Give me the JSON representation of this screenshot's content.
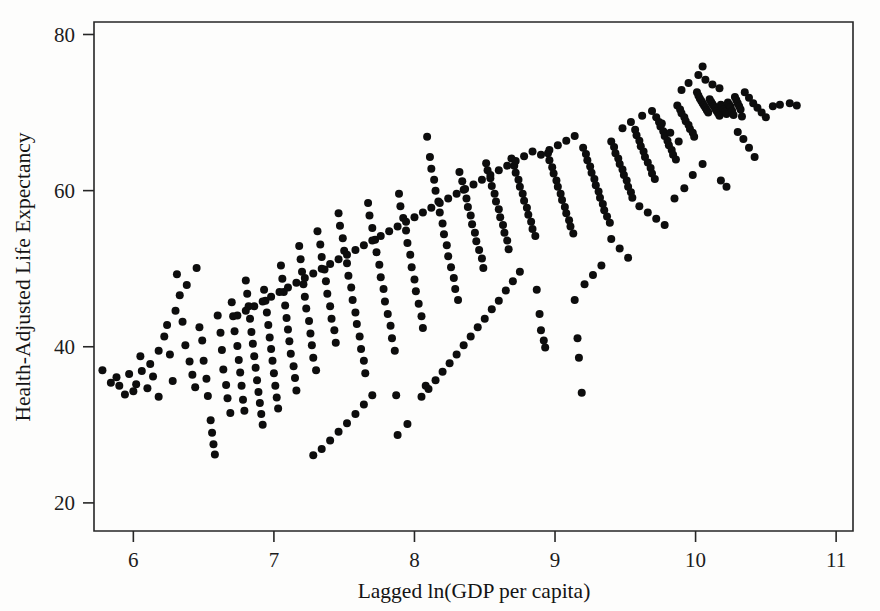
{
  "figure": {
    "type": "scatter-plot",
    "background_color": "#fdfdfc",
    "point_color": "#0d0d0d",
    "axis_color": "#262626"
  },
  "axes": {
    "x": {
      "label": "Lagged ln(GDP per capita)",
      "ticks": [
        "6",
        "7",
        "8",
        "9",
        "10",
        "11"
      ],
      "tick_values": [
        6,
        7,
        8,
        9,
        10,
        11
      ],
      "range": [
        5.72,
        11.12
      ]
    },
    "y": {
      "label": "Health-Adjusted Life Expectancy",
      "ticks": [
        "20",
        "80",
        "60",
        "40"
      ],
      "tick_labels": [
        "80",
        "60",
        "40",
        "20"
      ],
      "tick_values": [
        80,
        60,
        40,
        20
      ],
      "range": [
        16.4,
        81.6
      ]
    }
  },
  "chart_data": {
    "type": "scatter",
    "title": "",
    "xlabel": "Lagged ln(GDP per capita)",
    "ylabel": "Health-Adjusted Life Expectancy",
    "xlim": [
      5.72,
      11.12
    ],
    "ylim": [
      16.4,
      81.6
    ],
    "xticks": [
      6,
      7,
      8,
      9,
      10,
      11
    ],
    "yticks": [
      20,
      40,
      60,
      80
    ],
    "grid": false,
    "legend": null,
    "marker": "filled-circle",
    "marker_size_px": 8,
    "n_points": 420,
    "points": [
      [
        5.78,
        37.0
      ],
      [
        5.84,
        35.4
      ],
      [
        5.9,
        35.0
      ],
      [
        5.97,
        36.5
      ],
      [
        6.02,
        35.2
      ],
      [
        6.05,
        38.8
      ],
      [
        6.1,
        34.7
      ],
      [
        6.14,
        36.2
      ],
      [
        6.18,
        33.6
      ],
      [
        6.22,
        41.3
      ],
      [
        6.26,
        39.0
      ],
      [
        6.28,
        35.6
      ],
      [
        6.31,
        49.3
      ],
      [
        6.33,
        46.6
      ],
      [
        6.35,
        43.2
      ],
      [
        6.37,
        40.2
      ],
      [
        6.4,
        38.1
      ],
      [
        6.42,
        36.4
      ],
      [
        6.44,
        34.8
      ],
      [
        6.47,
        42.5
      ],
      [
        6.49,
        40.8
      ],
      [
        6.5,
        38.2
      ],
      [
        6.52,
        35.9
      ],
      [
        6.53,
        33.7
      ],
      [
        6.55,
        30.6
      ],
      [
        6.56,
        29.0
      ],
      [
        6.57,
        27.5
      ],
      [
        6.58,
        26.2
      ],
      [
        6.6,
        44.0
      ],
      [
        6.62,
        41.8
      ],
      [
        6.63,
        39.6
      ],
      [
        6.64,
        37.1
      ],
      [
        6.66,
        35.1
      ],
      [
        6.67,
        33.4
      ],
      [
        6.69,
        31.5
      ],
      [
        6.7,
        45.7
      ],
      [
        6.71,
        43.9
      ],
      [
        6.72,
        42.0
      ],
      [
        6.74,
        40.1
      ],
      [
        6.75,
        38.3
      ],
      [
        6.76,
        36.7
      ],
      [
        6.77,
        35.0
      ],
      [
        6.78,
        33.2
      ],
      [
        6.79,
        31.8
      ],
      [
        6.8,
        48.5
      ],
      [
        6.81,
        46.8
      ],
      [
        6.82,
        45.2
      ],
      [
        6.83,
        43.6
      ],
      [
        6.84,
        41.9
      ],
      [
        6.85,
        40.4
      ],
      [
        6.86,
        38.8
      ],
      [
        6.87,
        37.3
      ],
      [
        6.88,
        35.7
      ],
      [
        6.89,
        34.2
      ],
      [
        6.9,
        32.8
      ],
      [
        6.91,
        31.4
      ],
      [
        6.92,
        30.0
      ],
      [
        6.93,
        47.3
      ],
      [
        6.94,
        45.9
      ],
      [
        6.95,
        44.4
      ],
      [
        6.96,
        42.8
      ],
      [
        6.97,
        41.2
      ],
      [
        6.98,
        39.7
      ],
      [
        6.99,
        38.2
      ],
      [
        7.0,
        36.6
      ],
      [
        7.01,
        35.0
      ],
      [
        7.02,
        33.5
      ],
      [
        7.03,
        32.1
      ],
      [
        7.05,
        50.4
      ],
      [
        7.06,
        48.7
      ],
      [
        7.07,
        47.0
      ],
      [
        7.08,
        45.3
      ],
      [
        7.09,
        43.7
      ],
      [
        7.1,
        42.2
      ],
      [
        7.11,
        40.7
      ],
      [
        7.12,
        39.1
      ],
      [
        7.14,
        37.5
      ],
      [
        7.15,
        36.0
      ],
      [
        7.16,
        34.4
      ],
      [
        7.18,
        52.9
      ],
      [
        7.19,
        51.2
      ],
      [
        7.2,
        49.6
      ],
      [
        7.21,
        48.0
      ],
      [
        7.22,
        46.4
      ],
      [
        7.23,
        44.9
      ],
      [
        7.25,
        43.3
      ],
      [
        7.26,
        41.7
      ],
      [
        7.27,
        40.2
      ],
      [
        7.28,
        38.6
      ],
      [
        7.3,
        37.0
      ],
      [
        7.31,
        54.8
      ],
      [
        7.33,
        53.1
      ],
      [
        7.34,
        51.5
      ],
      [
        7.36,
        49.9
      ],
      [
        7.37,
        48.4
      ],
      [
        7.38,
        46.8
      ],
      [
        7.4,
        45.2
      ],
      [
        7.41,
        43.6
      ],
      [
        7.43,
        42.1
      ],
      [
        7.44,
        40.5
      ],
      [
        7.46,
        57.1
      ],
      [
        7.47,
        55.5
      ],
      [
        7.49,
        53.9
      ],
      [
        7.5,
        52.3
      ],
      [
        7.52,
        50.7
      ],
      [
        7.53,
        49.1
      ],
      [
        7.55,
        47.6
      ],
      [
        7.56,
        46.0
      ],
      [
        7.58,
        44.4
      ],
      [
        7.59,
        42.9
      ],
      [
        7.61,
        41.3
      ],
      [
        7.62,
        39.7
      ],
      [
        7.64,
        38.2
      ],
      [
        7.65,
        36.6
      ],
      [
        7.67,
        58.4
      ],
      [
        7.68,
        56.8
      ],
      [
        7.7,
        55.2
      ],
      [
        7.72,
        53.7
      ],
      [
        7.73,
        52.1
      ],
      [
        7.75,
        50.5
      ],
      [
        7.76,
        48.9
      ],
      [
        7.78,
        47.4
      ],
      [
        7.79,
        45.8
      ],
      [
        7.81,
        44.2
      ],
      [
        7.83,
        42.7
      ],
      [
        7.84,
        41.1
      ],
      [
        7.86,
        39.5
      ],
      [
        7.87,
        33.8
      ],
      [
        7.89,
        59.6
      ],
      [
        7.9,
        58.0
      ],
      [
        7.92,
        56.5
      ],
      [
        7.94,
        54.9
      ],
      [
        7.95,
        53.3
      ],
      [
        7.97,
        51.8
      ],
      [
        7.98,
        50.2
      ],
      [
        8.0,
        48.6
      ],
      [
        8.01,
        47.1
      ],
      [
        8.03,
        45.5
      ],
      [
        8.05,
        43.9
      ],
      [
        8.06,
        42.4
      ],
      [
        8.08,
        35.0
      ],
      [
        8.09,
        66.9
      ],
      [
        8.11,
        64.3
      ],
      [
        8.12,
        62.8
      ],
      [
        8.14,
        61.4
      ],
      [
        8.15,
        60.0
      ],
      [
        8.17,
        58.6
      ],
      [
        8.18,
        57.2
      ],
      [
        8.2,
        55.8
      ],
      [
        8.21,
        54.4
      ],
      [
        8.23,
        53.0
      ],
      [
        8.24,
        51.6
      ],
      [
        8.26,
        50.2
      ],
      [
        8.28,
        48.8
      ],
      [
        8.29,
        47.4
      ],
      [
        8.31,
        46.0
      ],
      [
        8.32,
        62.4
      ],
      [
        8.34,
        61.2
      ],
      [
        8.35,
        60.1
      ],
      [
        8.37,
        59.0
      ],
      [
        8.38,
        57.9
      ],
      [
        8.4,
        56.8
      ],
      [
        8.41,
        55.7
      ],
      [
        8.43,
        54.6
      ],
      [
        8.44,
        53.5
      ],
      [
        8.46,
        52.4
      ],
      [
        8.48,
        51.3
      ],
      [
        8.49,
        50.1
      ],
      [
        8.51,
        63.5
      ],
      [
        8.52,
        62.6
      ],
      [
        8.54,
        61.6
      ],
      [
        8.55,
        60.6
      ],
      [
        8.57,
        59.6
      ],
      [
        8.58,
        58.6
      ],
      [
        8.6,
        57.6
      ],
      [
        8.61,
        56.6
      ],
      [
        8.63,
        55.6
      ],
      [
        8.64,
        54.6
      ],
      [
        8.66,
        53.6
      ],
      [
        8.67,
        52.5
      ],
      [
        8.69,
        64.1
      ],
      [
        8.71,
        63.2
      ],
      [
        8.72,
        62.3
      ],
      [
        8.74,
        61.4
      ],
      [
        8.75,
        60.5
      ],
      [
        8.77,
        59.6
      ],
      [
        8.78,
        58.7
      ],
      [
        8.8,
        57.8
      ],
      [
        8.81,
        56.9
      ],
      [
        8.83,
        56.0
      ],
      [
        8.84,
        55.1
      ],
      [
        8.86,
        54.2
      ],
      [
        8.87,
        47.3
      ],
      [
        8.89,
        44.2
      ],
      [
        8.9,
        42.1
      ],
      [
        8.92,
        40.8
      ],
      [
        8.93,
        39.9
      ],
      [
        8.95,
        64.8
      ],
      [
        8.96,
        63.9
      ],
      [
        8.98,
        63.0
      ],
      [
        8.99,
        62.2
      ],
      [
        9.01,
        61.3
      ],
      [
        9.02,
        60.5
      ],
      [
        9.04,
        59.6
      ],
      [
        9.05,
        58.8
      ],
      [
        9.07,
        57.9
      ],
      [
        9.08,
        57.1
      ],
      [
        9.1,
        56.2
      ],
      [
        9.11,
        55.4
      ],
      [
        9.13,
        54.5
      ],
      [
        9.14,
        46.0
      ],
      [
        9.16,
        41.1
      ],
      [
        9.17,
        38.6
      ],
      [
        9.19,
        34.1
      ],
      [
        9.2,
        65.5
      ],
      [
        9.22,
        64.7
      ],
      [
        9.23,
        63.9
      ],
      [
        9.25,
        63.1
      ],
      [
        9.26,
        62.3
      ],
      [
        9.28,
        61.5
      ],
      [
        9.29,
        60.7
      ],
      [
        9.31,
        59.9
      ],
      [
        9.32,
        59.1
      ],
      [
        9.34,
        58.3
      ],
      [
        9.35,
        57.5
      ],
      [
        9.37,
        56.7
      ],
      [
        9.39,
        55.9
      ],
      [
        9.4,
        66.3
      ],
      [
        9.42,
        65.6
      ],
      [
        9.43,
        64.8
      ],
      [
        9.45,
        64.1
      ],
      [
        9.46,
        63.4
      ],
      [
        9.48,
        62.7
      ],
      [
        9.49,
        62.0
      ],
      [
        9.51,
        61.3
      ],
      [
        9.52,
        60.5
      ],
      [
        9.54,
        59.8
      ],
      [
        9.55,
        59.1
      ],
      [
        9.57,
        67.8
      ],
      [
        9.58,
        67.1
      ],
      [
        9.6,
        66.4
      ],
      [
        9.61,
        65.7
      ],
      [
        9.63,
        65.0
      ],
      [
        9.64,
        64.3
      ],
      [
        9.66,
        63.6
      ],
      [
        9.68,
        62.9
      ],
      [
        9.69,
        62.2
      ],
      [
        9.71,
        61.5
      ],
      [
        9.72,
        69.4
      ],
      [
        9.74,
        68.8
      ],
      [
        9.75,
        68.2
      ],
      [
        9.77,
        67.6
      ],
      [
        9.78,
        67.0
      ],
      [
        9.8,
        66.4
      ],
      [
        9.81,
        65.8
      ],
      [
        9.83,
        65.2
      ],
      [
        9.84,
        64.6
      ],
      [
        9.86,
        64.0
      ],
      [
        9.87,
        70.9
      ],
      [
        9.89,
        70.4
      ],
      [
        9.9,
        69.9
      ],
      [
        9.92,
        69.4
      ],
      [
        9.93,
        68.9
      ],
      [
        9.95,
        68.4
      ],
      [
        9.96,
        67.9
      ],
      [
        9.98,
        67.4
      ],
      [
        9.99,
        66.9
      ],
      [
        10.01,
        72.6
      ],
      [
        10.02,
        72.2
      ],
      [
        10.03,
        71.8
      ],
      [
        10.04,
        71.5
      ],
      [
        10.05,
        71.2
      ],
      [
        10.06,
        70.9
      ],
      [
        10.07,
        70.6
      ],
      [
        10.08,
        70.3
      ],
      [
        10.09,
        70.0
      ],
      [
        10.1,
        71.7
      ],
      [
        10.11,
        71.4
      ],
      [
        10.12,
        71.1
      ],
      [
        10.13,
        70.8
      ],
      [
        10.14,
        70.5
      ],
      [
        10.15,
        70.2
      ],
      [
        10.16,
        69.9
      ],
      [
        10.17,
        69.6
      ],
      [
        10.18,
        71.0
      ],
      [
        10.19,
        70.7
      ],
      [
        10.2,
        70.4
      ],
      [
        10.21,
        70.1
      ],
      [
        10.22,
        69.8
      ],
      [
        10.23,
        71.3
      ],
      [
        10.24,
        71.0
      ],
      [
        10.25,
        70.7
      ],
      [
        10.26,
        70.2
      ],
      [
        10.27,
        69.7
      ],
      [
        10.28,
        72.0
      ],
      [
        10.29,
        71.6
      ],
      [
        10.3,
        71.2
      ],
      [
        10.31,
        70.8
      ],
      [
        10.32,
        70.4
      ],
      [
        10.33,
        69.5
      ],
      [
        10.05,
        75.9
      ],
      [
        10.02,
        74.8
      ],
      [
        10.07,
        74.2
      ],
      [
        10.12,
        73.6
      ],
      [
        10.17,
        73.1
      ],
      [
        9.95,
        73.8
      ],
      [
        9.9,
        72.9
      ],
      [
        10.35,
        72.6
      ],
      [
        10.38,
        71.9
      ],
      [
        10.41,
        71.2
      ],
      [
        10.44,
        70.6
      ],
      [
        10.47,
        70.0
      ],
      [
        10.5,
        69.4
      ],
      [
        10.55,
        70.8
      ],
      [
        10.6,
        71.0
      ],
      [
        10.67,
        71.2
      ],
      [
        10.72,
        70.9
      ],
      [
        10.3,
        67.5
      ],
      [
        10.34,
        66.6
      ],
      [
        10.38,
        65.5
      ],
      [
        10.42,
        64.3
      ],
      [
        10.18,
        61.3
      ],
      [
        10.22,
        60.5
      ],
      [
        9.6,
        58.0
      ],
      [
        9.66,
        57.2
      ],
      [
        9.72,
        56.4
      ],
      [
        9.78,
        55.6
      ],
      [
        9.85,
        59.0
      ],
      [
        9.92,
        60.3
      ],
      [
        9.98,
        62.0
      ],
      [
        10.05,
        63.4
      ],
      [
        9.4,
        53.8
      ],
      [
        9.46,
        52.6
      ],
      [
        9.52,
        51.4
      ],
      [
        9.33,
        50.4
      ],
      [
        9.27,
        49.2
      ],
      [
        9.21,
        48.0
      ],
      [
        9.48,
        68.0
      ],
      [
        9.54,
        68.8
      ],
      [
        9.62,
        69.6
      ],
      [
        9.69,
        70.2
      ],
      [
        9.76,
        68.6
      ],
      [
        9.82,
        67.4
      ],
      [
        9.88,
        66.3
      ],
      [
        8.75,
        49.6
      ],
      [
        8.7,
        48.4
      ],
      [
        8.65,
        47.2
      ],
      [
        8.6,
        45.9
      ],
      [
        8.55,
        44.8
      ],
      [
        8.5,
        43.6
      ],
      [
        8.45,
        42.5
      ],
      [
        8.4,
        41.3
      ],
      [
        8.35,
        40.2
      ],
      [
        8.3,
        39.0
      ],
      [
        8.25,
        37.9
      ],
      [
        8.2,
        36.8
      ],
      [
        8.15,
        35.7
      ],
      [
        8.1,
        34.6
      ],
      [
        8.05,
        33.6
      ],
      [
        7.95,
        30.1
      ],
      [
        7.88,
        28.7
      ],
      [
        7.7,
        33.8
      ],
      [
        7.64,
        32.6
      ],
      [
        7.58,
        31.4
      ],
      [
        7.52,
        30.2
      ],
      [
        7.46,
        29.1
      ],
      [
        7.4,
        28.0
      ],
      [
        7.34,
        26.9
      ],
      [
        7.28,
        26.1
      ],
      [
        6.45,
        50.1
      ],
      [
        6.38,
        47.9
      ],
      [
        6.3,
        44.6
      ],
      [
        6.24,
        42.8
      ],
      [
        6.18,
        39.5
      ],
      [
        6.12,
        37.8
      ],
      [
        6.06,
        36.9
      ],
      [
        6.0,
        34.3
      ],
      [
        5.94,
        33.9
      ],
      [
        5.88,
        36.1
      ],
      [
        8.9,
        64.6
      ],
      [
        8.96,
        65.2
      ],
      [
        9.02,
        65.8
      ],
      [
        9.08,
        66.4
      ],
      [
        9.14,
        67.0
      ],
      [
        8.84,
        65.0
      ],
      [
        8.78,
        64.4
      ],
      [
        8.72,
        63.8
      ],
      [
        8.66,
        63.2
      ],
      [
        8.6,
        62.6
      ],
      [
        8.54,
        62.0
      ],
      [
        8.48,
        61.4
      ],
      [
        8.42,
        60.8
      ],
      [
        8.36,
        60.2
      ],
      [
        8.3,
        59.6
      ],
      [
        8.24,
        59.0
      ],
      [
        8.18,
        58.4
      ],
      [
        8.12,
        57.8
      ],
      [
        8.06,
        57.2
      ],
      [
        8.0,
        56.6
      ],
      [
        7.94,
        56.0
      ],
      [
        7.88,
        55.4
      ],
      [
        7.82,
        54.8
      ],
      [
        7.76,
        54.2
      ],
      [
        7.7,
        53.6
      ],
      [
        7.64,
        53.0
      ],
      [
        7.58,
        52.4
      ],
      [
        7.52,
        51.8
      ],
      [
        7.46,
        51.2
      ],
      [
        7.4,
        50.6
      ],
      [
        7.34,
        50.0
      ],
      [
        7.28,
        49.4
      ],
      [
        7.22,
        48.8
      ],
      [
        7.16,
        48.2
      ],
      [
        7.1,
        47.6
      ],
      [
        7.04,
        47.0
      ],
      [
        6.98,
        46.4
      ],
      [
        6.92,
        45.8
      ],
      [
        6.86,
        45.2
      ],
      [
        6.8,
        44.6
      ],
      [
        6.74,
        44.0
      ]
    ]
  }
}
